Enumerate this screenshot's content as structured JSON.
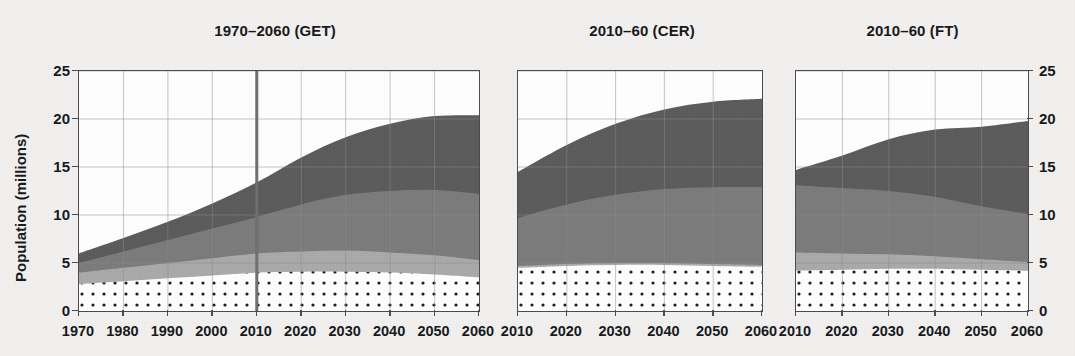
{
  "figure": {
    "axis_title_y": "Population (millions)",
    "colors": {
      "band_dotted_fill": "#ffffff",
      "band_dotted_dot": "#1a1a1a",
      "band_light": "#d8d8d8",
      "band_medium": "#a9a9a9",
      "band_dark": "#7a7a7a",
      "band_darkest": "#5a5a5a",
      "axis": "#4a4a4e",
      "grid": "#8c8c90",
      "marker_line": "#6e6e72",
      "text": "#16161a",
      "background": "#f2f1ef"
    }
  },
  "chart_data": [
    {
      "type": "area",
      "stacked": true,
      "title": "1970–2060 (GET)",
      "xlabel": "",
      "ylabel": "Population (millions)",
      "ylim": [
        0,
        25
      ],
      "xlim": [
        1970,
        2060
      ],
      "grid": true,
      "yticks": [
        0,
        5,
        10,
        15,
        20,
        25
      ],
      "ytick_labels": [
        "0",
        "5",
        "10",
        "15",
        "20",
        "25"
      ],
      "ytick_side": "left",
      "x": [
        1970,
        1980,
        1990,
        2000,
        2010,
        2020,
        2030,
        2040,
        2050,
        2060
      ],
      "xtick_labels": [
        "1970",
        "1980",
        "1990",
        "2000",
        "2010",
        "2020",
        "2030",
        "2040",
        "2050",
        "2060"
      ],
      "annotations": [
        {
          "type": "vline",
          "x": 2010,
          "label": ""
        }
      ],
      "series": [
        {
          "name": "band-1-dotted",
          "pattern": "dots",
          "values": [
            2.8,
            3.1,
            3.4,
            3.7,
            4.0,
            4.1,
            4.1,
            4.0,
            3.8,
            3.5
          ]
        },
        {
          "name": "band-2-light",
          "pattern": "solid",
          "values": [
            1.2,
            1.4,
            1.6,
            1.8,
            2.0,
            2.1,
            2.2,
            2.1,
            2.0,
            1.8
          ]
        },
        {
          "name": "band-3-medium",
          "pattern": "solid",
          "values": [
            1.0,
            1.7,
            2.4,
            3.1,
            3.8,
            4.9,
            5.8,
            6.4,
            6.8,
            6.9
          ]
        },
        {
          "name": "band-4-dark",
          "pattern": "solid",
          "values": [
            1.0,
            1.4,
            1.9,
            2.6,
            3.6,
            4.9,
            6.0,
            7.0,
            7.7,
            8.2
          ]
        }
      ],
      "totals": [
        6.0,
        7.6,
        9.3,
        11.2,
        13.4,
        16.0,
        18.1,
        19.5,
        20.3,
        20.4
      ]
    },
    {
      "type": "area",
      "stacked": true,
      "title": "2010–60 (CER)",
      "xlabel": "",
      "ylabel": "",
      "ylim": [
        0,
        25
      ],
      "xlim": [
        2010,
        2060
      ],
      "grid": true,
      "yticks": [
        0,
        5,
        10,
        15,
        20,
        25
      ],
      "ytick_labels": [],
      "ytick_side": "none",
      "x": [
        2010,
        2020,
        2030,
        2040,
        2050,
        2060
      ],
      "xtick_labels": [
        "2010",
        "2020",
        "2030",
        "2040",
        "2050",
        "2060"
      ],
      "annotations": [],
      "series": [
        {
          "name": "band-1-dotted",
          "pattern": "dots",
          "values": [
            4.5,
            4.7,
            4.8,
            4.8,
            4.7,
            4.6
          ]
        },
        {
          "name": "band-2-light",
          "pattern": "solid",
          "values": [
            0.2,
            0.2,
            0.2,
            0.2,
            0.2,
            0.2
          ]
        },
        {
          "name": "band-3-medium",
          "pattern": "solid",
          "values": [
            5.0,
            6.2,
            7.1,
            7.7,
            8.0,
            8.1
          ]
        },
        {
          "name": "band-4-dark",
          "pattern": "solid",
          "values": [
            4.8,
            6.2,
            7.4,
            8.3,
            8.9,
            9.2
          ]
        }
      ],
      "totals": [
        14.5,
        17.3,
        19.5,
        21.0,
        21.8,
        22.1
      ]
    },
    {
      "type": "area",
      "stacked": true,
      "title": "2010–60 (FT)",
      "xlabel": "",
      "ylabel": "",
      "ylim": [
        0,
        25
      ],
      "xlim": [
        2010,
        2060
      ],
      "grid": true,
      "yticks": [
        0,
        5,
        10,
        15,
        20,
        25
      ],
      "ytick_labels": [
        "0",
        "5",
        "10",
        "15",
        "20",
        "25"
      ],
      "ytick_side": "right",
      "x": [
        2010,
        2020,
        2030,
        2040,
        2050,
        2060
      ],
      "xtick_labels": [
        "2010",
        "2020",
        "2030",
        "2040",
        "2050",
        "2060"
      ],
      "annotations": [],
      "series": [
        {
          "name": "band-1-dotted",
          "pattern": "dots",
          "values": [
            4.2,
            4.3,
            4.4,
            4.4,
            4.3,
            4.2
          ]
        },
        {
          "name": "band-2-light",
          "pattern": "solid",
          "values": [
            1.9,
            1.7,
            1.5,
            1.3,
            1.1,
            0.9
          ]
        },
        {
          "name": "band-3-medium",
          "pattern": "solid",
          "values": [
            7.0,
            6.8,
            6.6,
            6.2,
            5.5,
            5.0
          ]
        },
        {
          "name": "band-4-dark",
          "pattern": "solid",
          "values": [
            1.6,
            3.4,
            5.4,
            7.0,
            8.3,
            9.7
          ]
        }
      ],
      "totals": [
        14.7,
        16.2,
        17.9,
        18.9,
        19.2,
        19.8
      ]
    }
  ]
}
